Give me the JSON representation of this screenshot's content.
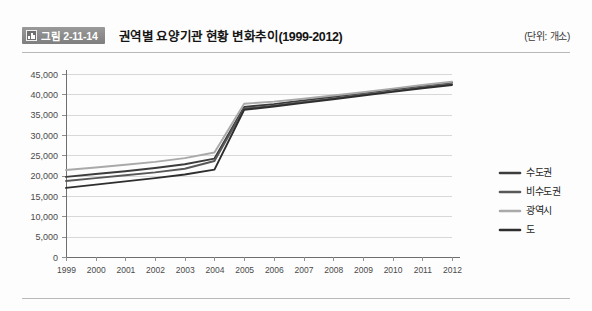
{
  "header": {
    "badge_icon": "bar-chart-icon",
    "badge_label": "그림 2-11-14",
    "title": "권역별 요양기관 현황 변화추이(1999-2012)",
    "unit_note": "(단위: 개소)"
  },
  "chart_data": {
    "type": "line",
    "title": "권역별 요양기관 현황 변화추이(1999-2012)",
    "xlabel": "",
    "ylabel": "",
    "unit": "개소",
    "grid": true,
    "legend_position": "right",
    "ylim": [
      0,
      45000
    ],
    "yticks": [
      0,
      5000,
      10000,
      15000,
      20000,
      25000,
      30000,
      35000,
      40000,
      45000
    ],
    "ytick_labels": [
      "0",
      "5,000",
      "10,000",
      "15,000",
      "20,000",
      "25,000",
      "30,000",
      "35,000",
      "40,000",
      "45,000"
    ],
    "categories": [
      "1999",
      "2000",
      "2001",
      "2002",
      "2003",
      "2004",
      "2005",
      "2006",
      "2007",
      "2008",
      "2009",
      "2010",
      "2011",
      "2012"
    ],
    "series": [
      {
        "name": "수도권",
        "color": "#3c3c3c",
        "values": [
          19700,
          20400,
          21100,
          21900,
          22800,
          24200,
          36900,
          37600,
          38500,
          39400,
          40300,
          41200,
          42100,
          42900
        ]
      },
      {
        "name": "비수도권",
        "color": "#585858",
        "values": [
          18700,
          19400,
          20100,
          20800,
          21700,
          23600,
          36500,
          37200,
          38100,
          39000,
          39900,
          40800,
          41700,
          42500
        ]
      },
      {
        "name": "광역시",
        "color": "#a9a9a9",
        "values": [
          21400,
          22000,
          22700,
          23400,
          24300,
          25700,
          37700,
          38200,
          38900,
          39700,
          40500,
          41400,
          42300,
          43100
        ]
      },
      {
        "name": "도",
        "color": "#2e2e2e",
        "values": [
          17000,
          17800,
          18600,
          19400,
          20300,
          21500,
          36200,
          37000,
          37900,
          38800,
          39700,
          40600,
          41500,
          42300
        ]
      }
    ]
  }
}
